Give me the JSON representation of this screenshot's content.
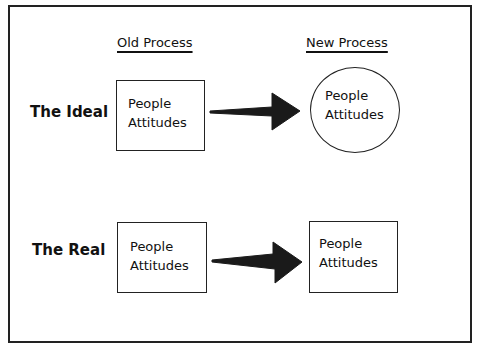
{
  "columns": {
    "old": "Old Process",
    "new": "New Process"
  },
  "rows": [
    {
      "label": "The Ideal",
      "old_box": {
        "shape": "rectangle",
        "line1": "People",
        "line2": "Attitudes"
      },
      "arrow": "right-arrow",
      "new_box": {
        "shape": "circle",
        "line1": "People",
        "line2": "Attitudes"
      }
    },
    {
      "label": "The Real",
      "old_box": {
        "shape": "rectangle",
        "line1": "People",
        "line2": "Attitudes"
      },
      "arrow": "right-arrow",
      "new_box": {
        "shape": "rectangle",
        "line1": "People",
        "line2": "Attitudes"
      }
    }
  ],
  "colors": {
    "stroke": "#222222",
    "arrow_fill": "#1a1a1a",
    "background": "#ffffff"
  }
}
